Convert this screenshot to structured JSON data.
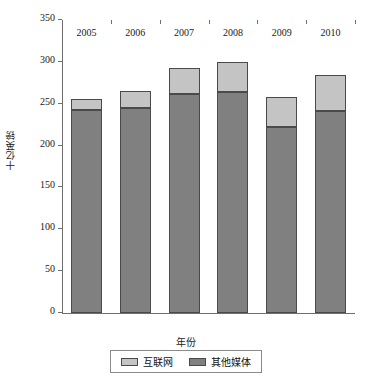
{
  "chart_data": {
    "type": "bar",
    "stacked": true,
    "title": "",
    "xlabel": "年份",
    "ylabel": "十亿英镑",
    "categories": [
      "2005",
      "2006",
      "2007",
      "2008",
      "2009",
      "2010"
    ],
    "series": [
      {
        "name": "其他媒体",
        "color": "#808080",
        "values": [
          242,
          245,
          262,
          264,
          222,
          241
        ]
      },
      {
        "name": "互联网",
        "color": "#c4c4c4",
        "values": [
          14,
          20,
          31,
          36,
          36,
          43
        ]
      }
    ],
    "totals": [
      256,
      265,
      293,
      300,
      258,
      284
    ],
    "ylim": [
      0,
      350
    ],
    "yticks": [
      0,
      50,
      100,
      150,
      200,
      250,
      300,
      350
    ],
    "ytick_labels": [
      "0",
      "50",
      "100",
      "150",
      "200",
      "250",
      "300",
      "350"
    ],
    "grid": false,
    "legend_position": "bottom",
    "legend_entries": [
      {
        "label": "互联网",
        "color": "#c4c4c4"
      },
      {
        "label": "其他媒体",
        "color": "#808080"
      }
    ]
  }
}
